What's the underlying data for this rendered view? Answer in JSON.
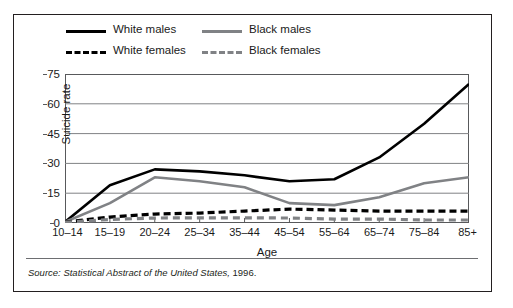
{
  "figure": {
    "source_prefix": "Source:",
    "source_italic": "Statistical Abstract of the United States,",
    "source_year": "1996."
  },
  "legend": {
    "items": [
      {
        "label": "White males",
        "style": "solid",
        "color": "#000000"
      },
      {
        "label": "White females",
        "style": "dashed",
        "color": "#000000"
      },
      {
        "label": "Black males",
        "style": "solid",
        "color": "#808285"
      },
      {
        "label": "Black females",
        "style": "dashed",
        "color": "#808285"
      }
    ]
  },
  "chart_data": {
    "type": "line",
    "title": "",
    "xlabel": "Age",
    "ylabel": "Suicide rate",
    "categories": [
      "10–14",
      "15–19",
      "20–24",
      "25–34",
      "35–44",
      "45–54",
      "55–64",
      "65–74",
      "75–84",
      "85+"
    ],
    "ylim": [
      0,
      75
    ],
    "yticks": [
      0,
      15,
      30,
      45,
      60,
      75
    ],
    "grid": "horizontal",
    "legend_position": "above-plot",
    "series": [
      {
        "name": "White males",
        "color": "#000000",
        "style": "solid",
        "values": [
          0.5,
          19,
          27,
          26,
          24,
          21,
          22,
          33,
          50,
          70
        ]
      },
      {
        "name": "Black males",
        "color": "#808285",
        "style": "solid",
        "values": [
          0.5,
          10,
          23,
          21,
          18,
          10,
          9,
          13,
          20,
          23
        ]
      },
      {
        "name": "White females",
        "color": "#000000",
        "style": "dashed",
        "values": [
          0.4,
          3,
          4.5,
          5,
          6,
          7,
          6.5,
          6,
          6,
          6
        ]
      },
      {
        "name": "Black females",
        "color": "#808285",
        "style": "dashed",
        "values": [
          0.3,
          1.8,
          2.5,
          2.6,
          2.6,
          2.5,
          2,
          2,
          1.5,
          1.5
        ]
      }
    ]
  }
}
